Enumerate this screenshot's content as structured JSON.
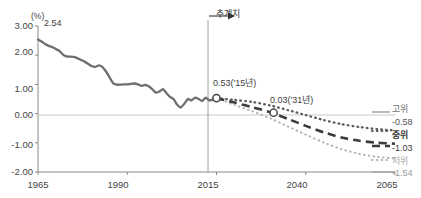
{
  "chart_data": {
    "type": "line",
    "title": "",
    "subtitle": "",
    "unit_label": "(%)",
    "xlabel": "",
    "ylabel": "",
    "xlim": [
      1965,
      2065
    ],
    "ylim": [
      -2.0,
      3.0
    ],
    "grid": false,
    "zero_line": true,
    "legend_position": "right-edge",
    "x_ticks": [
      "1965",
      "1990",
      "2015",
      "2040",
      "2065"
    ],
    "x_tick_values": [
      1965,
      1990,
      2015,
      2040,
      2065
    ],
    "y_ticks": [
      "3.00",
      "2.00",
      "1.00",
      "0.00",
      "-1.00",
      "-2.00"
    ],
    "y_tick_values": [
      3.0,
      2.0,
      1.0,
      0.0,
      -1.0,
      -2.0
    ],
    "projection_divider_year": 2015,
    "projection_marker_label": "추계치",
    "annotations": [
      {
        "text": "2.54",
        "x": 1965,
        "y": 2.54
      },
      {
        "text": "0.53('15년)",
        "x": 2015,
        "y": 0.53
      },
      {
        "text": "0.03('31년)",
        "x": 2031,
        "y": 0.03
      }
    ],
    "markers": [
      {
        "x": 2015,
        "y": 0.53
      },
      {
        "x": 2031,
        "y": 0.03
      }
    ],
    "series": [
      {
        "name": "실적치",
        "style": "solid",
        "color": "#6f6f6f",
        "x": [
          1965,
          1966,
          1967,
          1968,
          1969,
          1970,
          1971,
          1972,
          1973,
          1974,
          1975,
          1976,
          1977,
          1978,
          1979,
          1980,
          1981,
          1982,
          1983,
          1984,
          1985,
          1986,
          1987,
          1988,
          1989,
          1990,
          1991,
          1992,
          1993,
          1994,
          1995,
          1996,
          1997,
          1998,
          1999,
          2000,
          2001,
          2002,
          2003,
          2004,
          2005,
          2006,
          2007,
          2008,
          2009,
          2010,
          2011,
          2012,
          2013,
          2014,
          2015
        ],
        "values": [
          2.54,
          2.47,
          2.38,
          2.32,
          2.28,
          2.21,
          2.15,
          2.02,
          1.96,
          1.95,
          1.94,
          1.9,
          1.84,
          1.78,
          1.71,
          1.63,
          1.6,
          1.65,
          1.6,
          1.45,
          1.25,
          1.05,
          0.99,
          0.99,
          1.0,
          1.0,
          1.02,
          1.03,
          1.0,
          0.95,
          0.98,
          0.94,
          0.84,
          0.72,
          0.76,
          0.84,
          0.7,
          0.57,
          0.49,
          0.3,
          0.21,
          0.34,
          0.5,
          0.45,
          0.55,
          0.5,
          0.43,
          0.55,
          0.45,
          0.48,
          0.53
        ]
      },
      {
        "name": "고위",
        "style": "dotted-dark",
        "color": "#5c5c5c",
        "final_value": -0.58,
        "x": [
          2015,
          2020,
          2025,
          2030,
          2035,
          2040,
          2045,
          2050,
          2055,
          2060,
          2065
        ],
        "values": [
          0.53,
          0.47,
          0.4,
          0.28,
          0.12,
          -0.05,
          -0.22,
          -0.36,
          -0.46,
          -0.53,
          -0.58
        ]
      },
      {
        "name": "중위",
        "style": "dashed-dark",
        "color": "#3c3c3c",
        "final_value": -1.03,
        "x": [
          2015,
          2020,
          2025,
          2030,
          2035,
          2040,
          2045,
          2050,
          2055,
          2060,
          2065
        ],
        "values": [
          0.53,
          0.38,
          0.22,
          0.05,
          -0.18,
          -0.42,
          -0.64,
          -0.82,
          -0.93,
          -1.0,
          -1.03
        ]
      },
      {
        "name": "저위",
        "style": "dotted-light",
        "color": "#b5b5b5",
        "final_value": -1.54,
        "x": [
          2015,
          2020,
          2025,
          2030,
          2035,
          2040,
          2045,
          2050,
          2055,
          2060,
          2065
        ],
        "values": [
          0.53,
          0.3,
          0.08,
          -0.16,
          -0.44,
          -0.72,
          -0.99,
          -1.22,
          -1.38,
          -1.48,
          -1.54
        ]
      }
    ],
    "right_legend": [
      {
        "name": "고위",
        "value": "-0.58"
      },
      {
        "name": "중위",
        "value": "-1.03"
      },
      {
        "name": "저위",
        "value": "-1.54"
      }
    ]
  }
}
